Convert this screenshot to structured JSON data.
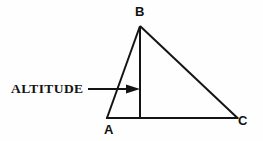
{
  "figure": {
    "background_color": "#fefefe",
    "line_color": "#141414",
    "annotation": {
      "label": "ALTITUDE",
      "points_to": "altitude-segment"
    },
    "vertices": [
      {
        "name": "B",
        "label": "B",
        "x": 140,
        "y": 26
      },
      {
        "name": "A",
        "label": "A",
        "x": 107,
        "y": 118
      },
      {
        "name": "C",
        "label": "C",
        "x": 237,
        "y": 118
      }
    ],
    "segments": [
      {
        "name": "side-ab",
        "from": "A",
        "to": "B"
      },
      {
        "name": "side-bc",
        "from": "B",
        "to": "C"
      },
      {
        "name": "base-ac",
        "from": "A",
        "to": "C"
      },
      {
        "name": "altitude-segment",
        "from": "B",
        "to": "foot-of-altitude"
      }
    ],
    "foot_of_altitude": {
      "x": 140,
      "y": 118
    },
    "arrow": {
      "from_x": 88,
      "to_x": 140,
      "y": 89
    }
  }
}
